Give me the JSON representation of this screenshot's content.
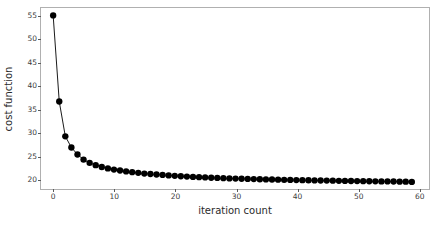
{
  "chart_data": {
    "type": "line",
    "title": "",
    "xlabel": "iteration count",
    "ylabel": "cost function",
    "xlim": [
      -2.0,
      61.5
    ],
    "ylim": [
      18.1,
      56.6
    ],
    "xticks": [
      0,
      10,
      20,
      30,
      40,
      50,
      60
    ],
    "xtick_labels": [
      "0",
      "10",
      "20",
      "30",
      "40",
      "50",
      "60"
    ],
    "yticks": [
      20,
      25,
      30,
      35,
      40,
      45,
      50,
      55
    ],
    "ytick_labels": [
      "20",
      "25",
      "30",
      "35",
      "40",
      "45",
      "50",
      "55"
    ],
    "grid": false,
    "legend": null,
    "marker": "o",
    "marker_color": "#000000",
    "line_color": "#000000",
    "line_width": 0.9,
    "marker_size": 3.2,
    "series": [
      {
        "name": "cost function",
        "x": [
          0,
          1,
          2,
          3,
          4,
          5,
          6,
          7,
          8,
          9,
          10,
          11,
          12,
          13,
          14,
          15,
          16,
          17,
          18,
          19,
          20,
          21,
          22,
          23,
          24,
          25,
          26,
          27,
          28,
          29,
          30,
          31,
          32,
          33,
          34,
          35,
          36,
          37,
          38,
          39,
          40,
          41,
          42,
          43,
          44,
          45,
          46,
          47,
          48,
          49,
          50,
          51,
          52,
          53,
          54,
          55,
          56,
          57,
          58,
          59
        ],
        "values": [
          55.0,
          36.5,
          29.0,
          26.6,
          25.1,
          24.0,
          23.3,
          22.8,
          22.4,
          22.1,
          21.85,
          21.65,
          21.45,
          21.3,
          21.15,
          21.0,
          20.9,
          20.8,
          20.7,
          20.6,
          20.5,
          20.42,
          20.35,
          20.28,
          20.22,
          20.16,
          20.1,
          20.05,
          20.0,
          19.96,
          19.92,
          19.88,
          19.84,
          19.8,
          19.77,
          19.74,
          19.71,
          19.68,
          19.65,
          19.62,
          19.6,
          19.57,
          19.55,
          19.53,
          19.5,
          19.48,
          19.46,
          19.44,
          19.42,
          19.4,
          19.38,
          19.36,
          19.34,
          19.33,
          19.31,
          19.3,
          19.28,
          19.26,
          19.25,
          19.2
        ]
      }
    ]
  }
}
